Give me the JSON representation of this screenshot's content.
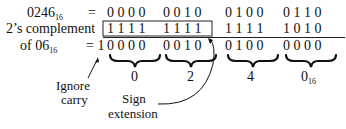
{
  "rows": [
    {
      "label": "0246",
      "label_sub": "16",
      "operator": "=",
      "groups": [
        "0 0 0 0",
        "0 0 1 0",
        "0 1 0 0",
        "0 1 1 0"
      ]
    },
    {
      "label": "2’s complement",
      "operator": "",
      "groups": [
        "1 1 1 1",
        "1 1 1 1",
        "1 1 1 1",
        "1 0 1 0"
      ]
    },
    {
      "label": "of 06",
      "label_sub": "16",
      "operator": "= 1",
      "groups": [
        "0 0 0 0",
        "0 0 1 0",
        "0 1 0 0",
        "0 0 0 0"
      ]
    }
  ],
  "hex_digits": [
    "0",
    "2",
    "4",
    "0"
  ],
  "hex_last_sub": "16",
  "annotations": {
    "ignore_carry_line1": "Ignore",
    "ignore_carry_line2": "carry",
    "sign_extension_line1": "Sign",
    "sign_extension_line2": "extension"
  }
}
